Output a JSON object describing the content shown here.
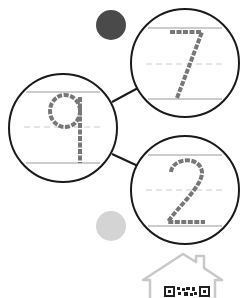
{
  "worksheet": {
    "digits": [
      {
        "value": "7",
        "cx": 185,
        "cy": 63,
        "r": 55
      },
      {
        "value": "9",
        "cx": 63,
        "cy": 128,
        "r": 55
      },
      {
        "value": "2",
        "cx": 185,
        "cy": 190,
        "r": 55
      }
    ],
    "dots": [
      {
        "name": "dark-dot",
        "cx": 111,
        "cy": 25,
        "r": 15,
        "color": "#4a4a4a"
      },
      {
        "name": "light-dot",
        "cx": 111,
        "cy": 226,
        "r": 15,
        "color": "#d2d2d2"
      }
    ],
    "colors": {
      "circle_stroke": "#1a1a1a",
      "guide_line": "#9a9a9a",
      "dashed_line": "#cccccc",
      "trace_stroke": "#777777",
      "house_stroke": "#c8c8c8"
    }
  }
}
